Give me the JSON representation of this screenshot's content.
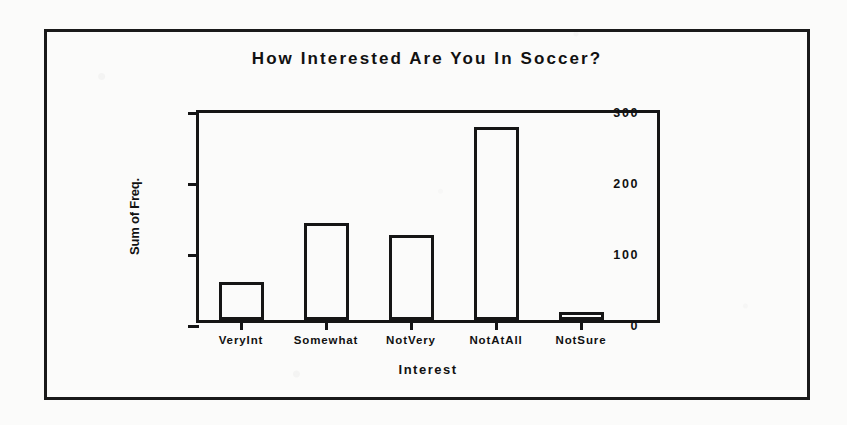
{
  "chart_data": {
    "type": "bar",
    "title": "How  Interested  Are  You  In  Soccer?",
    "xlabel": "Interest",
    "ylabel": "Sum of Freq.",
    "categories": [
      "VeryInt",
      "Somewhat",
      "NotVery",
      "NotAtAll",
      "NotSure"
    ],
    "values": [
      54,
      137,
      120,
      272,
      10
    ],
    "ylim": [
      0,
      300
    ],
    "yticks": [
      0,
      100,
      200,
      300
    ],
    "ytick_labels": [
      "0",
      "100",
      "200",
      "300"
    ],
    "grid": false,
    "legend": "none",
    "series": [
      {
        "name": "Sum of Freq.",
        "values": [
          54,
          137,
          120,
          272,
          10
        ]
      }
    ],
    "colors": {
      "bar_fill": "#ffffff",
      "bar_outline": "#151515",
      "axis": "#151515",
      "text": "#111111",
      "background": "#fbfbfa"
    }
  },
  "figure": {
    "title_text": "How  Interested  Are  You  In  Soccer?",
    "x_axis_title": "Interest",
    "y_axis_title": "Sum of Freq."
  }
}
